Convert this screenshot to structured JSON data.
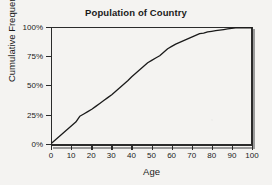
{
  "figure": {
    "background_color": "#f4f3f1",
    "ink_color": "#2b2b2b"
  },
  "chart_data": {
    "type": "line",
    "title": "Population of Country",
    "xlabel": "Age",
    "ylabel": "Cumulative Frequency",
    "xlim": [
      0,
      100
    ],
    "ylim": [
      0,
      100
    ],
    "grid": false,
    "legend": null,
    "x_ticks": [
      0,
      10,
      20,
      30,
      40,
      50,
      60,
      70,
      80,
      90,
      100
    ],
    "x_tick_labels": [
      "0",
      "10",
      "20",
      "30",
      "40",
      "50",
      "60",
      "70",
      "80",
      "90",
      "100"
    ],
    "y_ticks": [
      0,
      25,
      50,
      75,
      100
    ],
    "y_tick_labels": [
      "0%",
      "25%",
      "50%",
      "75%",
      "100%"
    ],
    "series": [
      {
        "name": "Cumulative frequency",
        "line_color": "#1a1a1a",
        "line_width": 1.3,
        "x": [
          0,
          2,
          4,
          6,
          8,
          10,
          12,
          14,
          16,
          18,
          20,
          22,
          24,
          26,
          28,
          30,
          32,
          34,
          36,
          38,
          40,
          42,
          44,
          46,
          48,
          50,
          52,
          54,
          56,
          58,
          60,
          62,
          64,
          66,
          68,
          70,
          72,
          74,
          76,
          78,
          80,
          82,
          84,
          86,
          88,
          90,
          92,
          94,
          96,
          98,
          100
        ],
        "y": [
          1,
          4,
          7,
          10,
          13,
          16,
          19,
          24,
          26,
          28,
          30,
          32.5,
          35,
          37.5,
          40,
          42.5,
          45.5,
          48.5,
          51.5,
          54.5,
          58,
          61,
          64,
          67,
          70,
          72,
          74,
          76,
          79,
          82,
          84,
          86,
          87.5,
          89,
          90.5,
          92,
          93.5,
          95,
          95.5,
          96.5,
          97,
          97.5,
          98,
          98.5,
          99,
          99.5,
          100,
          100,
          100,
          100,
          100
        ]
      }
    ],
    "annotations": [
      "Ogive (cumulative distribution) rises from 0% at age 0 to 100% at about age 92",
      "Visible inflection near age 14 at about 24%",
      "Median (50%) at approximately age 34",
      "75% reached at approximately age 53"
    ]
  }
}
